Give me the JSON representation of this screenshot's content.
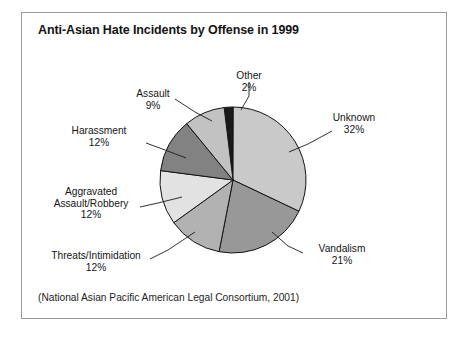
{
  "figure": {
    "title": "Anti-Asian Hate Incidents by Offense in 1999",
    "source_note": "(National Asian Pacific American Legal Consortium, 2001)",
    "background_color": "#ffffff",
    "border_color": "#9a9a9a"
  },
  "chart_data": {
    "type": "pie",
    "title": "Anti-Asian Hate Incidents by Offense in 1999",
    "xlabel": "",
    "ylabel": "",
    "value_unit": "percent",
    "start_angle_deg": -7,
    "direction": "clockwise",
    "legend": "none (direct labels with leader lines)",
    "grid": false,
    "categories": [
      "Other",
      "Unknown",
      "Vandalism",
      "Threats/Intimidation",
      "Aggravated Assault/Robbery",
      "Harassment",
      "Assault"
    ],
    "values": [
      2,
      32,
      21,
      12,
      12,
      12,
      9
    ],
    "colors": [
      "#1a1a1a",
      "#c9c9c9",
      "#989898",
      "#b2b2b2",
      "#e2e2e2",
      "#828282",
      "#c2c2c2"
    ],
    "slices": [
      {
        "label": "Other",
        "value": 2,
        "pct_text": "2%",
        "color": "#1a1a1a"
      },
      {
        "label": "Unknown",
        "value": 32,
        "pct_text": "32%",
        "color": "#c9c9c9"
      },
      {
        "label": "Vandalism",
        "value": 21,
        "pct_text": "21%",
        "color": "#989898"
      },
      {
        "label": "Threats/Intimidation",
        "value": 12,
        "pct_text": "12%",
        "color": "#b2b2b2"
      },
      {
        "label": "Aggravated Assault/Robbery",
        "value": 12,
        "pct_text": "12%",
        "color": "#e2e2e2"
      },
      {
        "label": "Harassment",
        "value": 12,
        "pct_text": "12%",
        "color": "#828282"
      },
      {
        "label": "Assault",
        "value": 9,
        "pct_text": "9%",
        "color": "#c2c2c2"
      }
    ]
  },
  "labels": {
    "other": {
      "name": "Other",
      "pct": "2%"
    },
    "unknown": {
      "name": "Unknown",
      "pct": "32%"
    },
    "vandalism": {
      "name": "Vandalism",
      "pct": "21%"
    },
    "threats": {
      "name": "Threats/Intimidation",
      "pct": "12%"
    },
    "aggravated": {
      "name_line1": "Aggravated",
      "name_line2": "Assault/Robbery",
      "pct": "12%"
    },
    "harassment": {
      "name": "Harassment",
      "pct": "12%"
    },
    "assault": {
      "name": "Assault",
      "pct": "9%"
    }
  }
}
